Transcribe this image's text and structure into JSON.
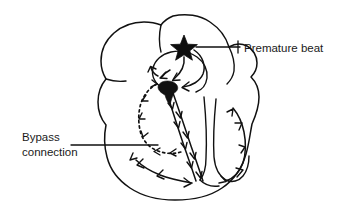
{
  "figure": {
    "background_color": "#ffffff",
    "ink_color": "#111111",
    "width": 337,
    "height": 209
  },
  "annotations": [
    {
      "id": "premature-beat",
      "label": "Premature beat",
      "marker": "star-icon",
      "marker_color": "#0d0d0d",
      "text_x": 244,
      "text_y": 52
    },
    {
      "id": "bypass-connection",
      "label_line_1": "Bypass",
      "label_line_2": "connection",
      "marker": "dotted-pathway",
      "text_x": 22,
      "text_y": 141
    }
  ],
  "pathways": [
    {
      "id": "normal-conduction",
      "name": "normal conduction pathway",
      "style": "solid",
      "direction": "antegrade"
    },
    {
      "id": "accessory-bypass",
      "name": "bypass connection pathway",
      "style": "dotted",
      "direction": "retrograde"
    }
  ]
}
